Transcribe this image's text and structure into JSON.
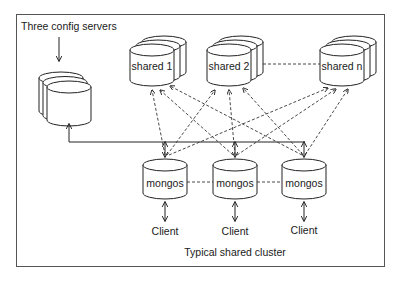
{
  "diagram": {
    "title": "Typical shared cluster",
    "config": {
      "label": "Three config servers",
      "count": 3
    },
    "shards": [
      {
        "label": "shared 1"
      },
      {
        "label": "shared 2"
      },
      {
        "label": "shared n"
      }
    ],
    "routers": [
      {
        "label": "mongos",
        "client": "Client"
      },
      {
        "label": "mongos",
        "client": "Client"
      },
      {
        "label": "mongos",
        "client": "Client"
      }
    ],
    "colors": {
      "stroke": "#222222",
      "background": "#ffffff",
      "frame": "#555555"
    }
  }
}
